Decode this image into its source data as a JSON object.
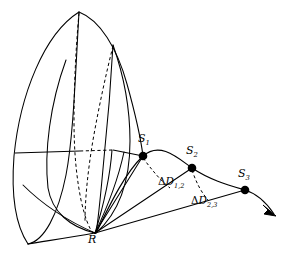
{
  "figure": {
    "title": "",
    "type": "ray-geometry-diagram",
    "background_color": "#ffffff",
    "stroke_color": "#000000",
    "width": 286,
    "height": 262
  },
  "labels": {
    "receiver": {
      "text": "R",
      "sub": "",
      "x": 88,
      "y": 238
    },
    "source_1": {
      "text": "S",
      "sub": "1",
      "x": 138,
      "y": 138
    },
    "source_2": {
      "text": "S",
      "sub": "2",
      "x": 186,
      "y": 150
    },
    "source_3": {
      "text": "S",
      "sub": "3",
      "x": 238,
      "y": 174
    },
    "delta_d_12": {
      "symbol": "Δ",
      "text": "D",
      "sub": "1,2",
      "x": 160,
      "y": 181
    },
    "delta_d_23": {
      "symbol": "Δ",
      "text": "D",
      "sub": "2,3",
      "x": 193,
      "y": 199
    }
  },
  "points": [
    {
      "name": "S1",
      "x": 143,
      "y": 156,
      "r": 4.2
    },
    {
      "name": "S2",
      "x": 192,
      "y": 168,
      "r": 4.2
    },
    {
      "name": "S3",
      "x": 245,
      "y": 190,
      "r": 4.2
    }
  ],
  "vertex": {
    "name": "R",
    "x": 95,
    "y": 233
  },
  "arrow": {
    "tip_x": 276,
    "tip_y": 216
  }
}
